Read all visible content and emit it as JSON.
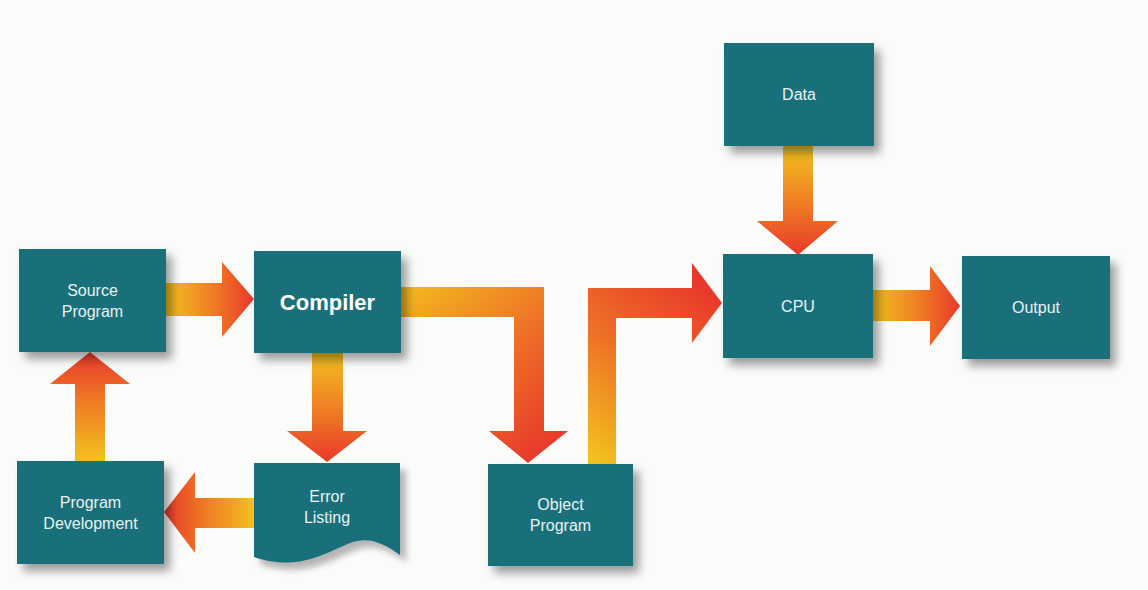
{
  "diagram": {
    "type": "flowchart",
    "nodes": {
      "source_program": {
        "label": "Source\nProgram"
      },
      "compiler": {
        "label": "Compiler"
      },
      "program_development": {
        "label": "Program\nDevelopment"
      },
      "error_listing": {
        "label": "Error\nListing",
        "shape": "document"
      },
      "object_program": {
        "label": "Object\nProgram"
      },
      "data": {
        "label": "Data"
      },
      "cpu": {
        "label": "CPU"
      },
      "output": {
        "label": "Output"
      }
    },
    "edges": [
      {
        "from": "Source Program",
        "to": "Compiler"
      },
      {
        "from": "Compiler",
        "to": "Error Listing"
      },
      {
        "from": "Error Listing",
        "to": "Program Development"
      },
      {
        "from": "Program Development",
        "to": "Source Program"
      },
      {
        "from": "Compiler",
        "to": "Object Program"
      },
      {
        "from": "Object Program",
        "to": "CPU"
      },
      {
        "from": "Data",
        "to": "CPU"
      },
      {
        "from": "CPU",
        "to": "Output"
      }
    ],
    "colors": {
      "node_fill": "#196f7a",
      "node_text": "#e9f2f3",
      "arrow_start": "#f2c21f",
      "arrow_end": "#e8392b",
      "background": "#fbfbfa"
    }
  }
}
